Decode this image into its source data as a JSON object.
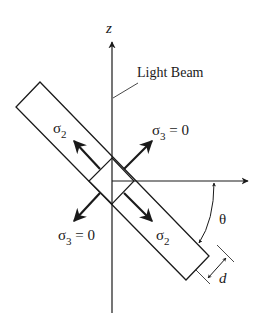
{
  "diagram": {
    "type": "photoelastic slab stress diagram",
    "labels": {
      "z_axis": "z",
      "light_beam": "Light Beam",
      "sigma2_upper": "σ",
      "sigma2_upper_sub": "2",
      "sigma3_upper": "σ",
      "sigma3_upper_sub": "3",
      "sigma3_upper_eq": " = 0",
      "sigma3_lower": "σ",
      "sigma3_lower_sub": "3",
      "sigma3_lower_eq": " = 0",
      "sigma2_lower": "σ",
      "sigma2_lower_sub": "2",
      "theta": "θ",
      "thickness": "d"
    },
    "colors": {
      "stroke": "#1a1a1a",
      "background": "#ffffff"
    }
  }
}
